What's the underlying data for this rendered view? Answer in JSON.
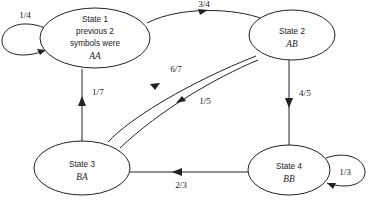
{
  "diagram": {
    "type": "state-transition-diagram",
    "title": "",
    "nodes": [
      {
        "id": "state1",
        "lines": [
          "State 1",
          "previous 2",
          "symbols were"
        ],
        "symbol": "AA",
        "cx": 95,
        "cy": 38,
        "rx": 55,
        "ry": 30
      },
      {
        "id": "state2",
        "lines": [
          "State 2"
        ],
        "symbol": "AB",
        "cx": 292,
        "cy": 35,
        "rx": 43,
        "ry": 25
      },
      {
        "id": "state3",
        "lines": [
          "State 3"
        ],
        "symbol": "BA",
        "cx": 82,
        "cy": 168,
        "rx": 48,
        "ry": 27
      },
      {
        "id": "state4",
        "lines": [
          "State 4"
        ],
        "symbol": "BB",
        "cx": 289,
        "cy": 170,
        "rx": 41,
        "ry": 25
      }
    ],
    "edges": [
      {
        "id": "e-1-1",
        "from": "state1",
        "to": "state1",
        "label": "1/4",
        "kind": "self-loop-left"
      },
      {
        "id": "e-1-2",
        "from": "state1",
        "to": "state2",
        "label": "3/4",
        "kind": "curve-top"
      },
      {
        "id": "e-3-1",
        "from": "state3",
        "to": "state1",
        "label": "1/7",
        "kind": "vertical-up"
      },
      {
        "id": "e-3-2",
        "from": "state3",
        "to": "state2",
        "label": "6/7",
        "kind": "curve-diagonal-up"
      },
      {
        "id": "e-2-3",
        "from": "state2",
        "to": "state3",
        "label": "1/5",
        "kind": "curve-diagonal-down"
      },
      {
        "id": "e-2-4",
        "from": "state2",
        "to": "state4",
        "label": "4/5",
        "kind": "vertical-down"
      },
      {
        "id": "e-4-3",
        "from": "state4",
        "to": "state3",
        "label": "2/3",
        "kind": "horizontal-left"
      },
      {
        "id": "e-4-4",
        "from": "state4",
        "to": "state4",
        "label": "1/3",
        "kind": "self-loop-right"
      }
    ],
    "labels": {
      "loop1": "1/4",
      "s1_s2": "3/4",
      "s3_s1": "1/7",
      "s3_s2": "6/7",
      "s2_s3": "1/5",
      "s2_s4": "4/5",
      "s4_s3": "2/3",
      "loop4": "1/3"
    },
    "colors": {
      "stroke": "#222222",
      "text": "#1a1a1a",
      "background": "#ffffff"
    }
  }
}
